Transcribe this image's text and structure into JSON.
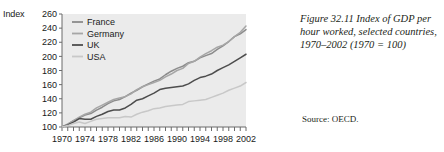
{
  "figure": {
    "axis_title": "Index",
    "caption": "Figure 32.11  Index of GDP per hour worked, selected countries, 1970–2002 (1970 = 100)",
    "source": "Source: OECD."
  },
  "chart_data": {
    "type": "line",
    "title": "Index of GDP per hour worked, selected countries, 1970–2002 (1970 = 100)",
    "xlabel": "",
    "ylabel": "Index",
    "xlim": [
      1970,
      2002
    ],
    "ylim": [
      100,
      260
    ],
    "yticks": [
      100,
      120,
      140,
      160,
      180,
      200,
      220,
      240,
      260
    ],
    "xticks": [
      1970,
      1974,
      1978,
      1982,
      1986,
      1990,
      1994,
      1998,
      2002
    ],
    "xtick_minor_step": 1,
    "grid": false,
    "legend_position": "top-left",
    "plot_background": "#ebebeb",
    "x": [
      1970,
      1971,
      1972,
      1973,
      1974,
      1975,
      1976,
      1977,
      1978,
      1979,
      1980,
      1981,
      1982,
      1983,
      1984,
      1985,
      1986,
      1987,
      1988,
      1989,
      1990,
      1991,
      1992,
      1993,
      1994,
      1995,
      1996,
      1997,
      1998,
      1999,
      2000,
      2001,
      2002
    ],
    "series": [
      {
        "name": "France",
        "color": "#8c8c8c",
        "values": [
          100,
          104,
          109,
          113,
          117,
          119,
          124,
          128,
          133,
          137,
          139,
          143,
          148,
          152,
          157,
          161,
          165,
          168,
          174,
          179,
          183,
          186,
          191,
          193,
          198,
          201,
          204,
          210,
          215,
          221,
          228,
          232,
          238
        ]
      },
      {
        "name": "Germany",
        "color": "#a6a6a6",
        "values": [
          100,
          104,
          109,
          114,
          118,
          121,
          127,
          131,
          135,
          139,
          141,
          143,
          147,
          153,
          157,
          160,
          163,
          166,
          171,
          175,
          180,
          183,
          190,
          193,
          199,
          204,
          208,
          213,
          216,
          221,
          228,
          234,
          243
        ]
      },
      {
        "name": "UK",
        "color": "#4d4d4d",
        "values": [
          100,
          103,
          107,
          112,
          111,
          111,
          115,
          118,
          122,
          124,
          124,
          127,
          132,
          138,
          140,
          144,
          148,
          153,
          155,
          156,
          157,
          158,
          161,
          166,
          170,
          172,
          175,
          180,
          184,
          188,
          193,
          198,
          203
        ]
      },
      {
        "name": "USA",
        "color": "#c8c8c8",
        "values": [
          100,
          102,
          105,
          107,
          105,
          108,
          111,
          112,
          113,
          113,
          113,
          115,
          114,
          118,
          121,
          123,
          126,
          127,
          129,
          130,
          131,
          132,
          136,
          137,
          138,
          139,
          142,
          145,
          148,
          152,
          155,
          158,
          163
        ]
      }
    ]
  }
}
